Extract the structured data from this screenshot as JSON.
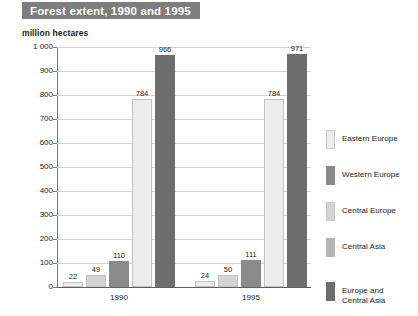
{
  "title": "Forest extent, 1990 and 1995",
  "axis_unit": "million hectares",
  "chart_data": {
    "type": "bar",
    "title": "Forest extent, 1990 and 1995",
    "xlabel": "",
    "ylabel": "million hectares",
    "ylim": [
      0,
      1000
    ],
    "ytick_labels": [
      "1 000",
      "900",
      "800",
      "700",
      "600",
      "500",
      "400",
      "300",
      "200",
      "100",
      "0"
    ],
    "ytick_values": [
      1000,
      900,
      800,
      700,
      600,
      500,
      400,
      300,
      200,
      100,
      0
    ],
    "grid": "horizontal",
    "legend_position": "right",
    "categories": [
      "1990",
      "1995"
    ],
    "series": [
      {
        "name": "Eastern Europe",
        "values": [
          22,
          49
        ],
        "color": "#ececec"
      },
      {
        "name": "Western Europe",
        "values": [
          49,
          50
        ],
        "color": "#8a8a8a"
      },
      {
        "name": "Central Europe",
        "values": [
          110,
          111
        ],
        "color": "#d9d9d9"
      },
      {
        "name": "Central Asia",
        "values": [
          784,
          784
        ],
        "color": "#b5b5b5"
      },
      {
        "name": "Europe and Central Asia",
        "values": [
          966,
          971
        ],
        "color": "#6e6e6e"
      }
    ],
    "groups": [
      {
        "label": "1990",
        "bars": [
          {
            "series": "Eastern Europe",
            "value": 22,
            "label": "22",
            "color": "#ececec"
          },
          {
            "series": "Western Europe",
            "value": 49,
            "label": "49",
            "color": "#d4d4d4"
          },
          {
            "series": "Central Europe",
            "value": 110,
            "label": "110",
            "color": "#8a8a8a"
          },
          {
            "series": "Central Asia",
            "value": 784,
            "label": "784",
            "color": "#ececec"
          },
          {
            "series": "Europe and Central Asia",
            "value": 966,
            "label": "966",
            "color": "#6e6e6e"
          }
        ]
      },
      {
        "label": "1995",
        "bars": [
          {
            "series": "Eastern Europe",
            "value": 24,
            "label": "24",
            "color": "#ececec"
          },
          {
            "series": "Western Europe",
            "value": 50,
            "label": "50",
            "color": "#d4d4d4"
          },
          {
            "series": "Central Europe",
            "value": 111,
            "label": "111",
            "color": "#8a8a8a"
          },
          {
            "series": "Central Asia",
            "value": 784,
            "label": "784",
            "color": "#ececec"
          },
          {
            "series": "Europe and Central Asia",
            "value": 971,
            "label": "971",
            "color": "#6e6e6e"
          }
        ]
      }
    ],
    "legend": [
      {
        "label": "Eastern Europe",
        "color": "#ececec"
      },
      {
        "label": "Western Europe",
        "color": "#8a8a8a"
      },
      {
        "label": "Central Europe",
        "color": "#d4d4d4"
      },
      {
        "label": "Central Asia",
        "color": "#b5b5b5"
      },
      {
        "label": "Europe and\nCentral Asia",
        "color": "#6e6e6e"
      }
    ]
  },
  "colors": {
    "title_banner_bg": "#7d7d7d",
    "title_banner_text": "#ffffff",
    "gridline": "#d2d2d2",
    "axis": "#7a7a7a",
    "background": "#ffffff"
  }
}
